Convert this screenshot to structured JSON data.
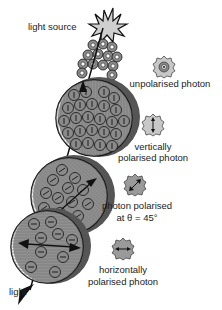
{
  "labels": {
    "light_source": "light source",
    "light": "light",
    "unpolarised_photon": "unpolarised photon",
    "vertically_line1": "vertically",
    "vertically_line2": "polarised photon",
    "deg45_line1": "photon polarised",
    "deg45_line2": "at θ = 45°",
    "horizontally_line1": "horizontally",
    "horizontally_line2": "polarised photon"
  },
  "legend": [
    {
      "id": "unpolarised",
      "icon": "unpolarised-photon-icon"
    },
    {
      "id": "vertical",
      "icon": "vertical-photon-icon"
    },
    {
      "id": "diagonal45",
      "icon": "diagonal-photon-icon"
    },
    {
      "id": "horizontal",
      "icon": "horizontal-photon-icon"
    }
  ],
  "colors": {
    "photon_fill": "#8a8a8a",
    "legend_fill": "#c8c8c8",
    "outline": "#111111",
    "disc_shade": "#555555"
  }
}
